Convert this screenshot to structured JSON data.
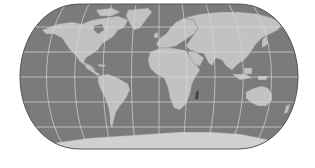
{
  "map": {
    "type": "world-map",
    "projection": "pseudo-cylindrical (Eckert IV-like)",
    "colors": {
      "background": "#ffffff",
      "ocean": "#7b7b7b",
      "land": "#c2c2c2",
      "land_dark": "#9a9a9a",
      "graticule": "#d8d8d8",
      "outline": "#4a4a4a",
      "ice": "#d0d0d0"
    },
    "graticule": {
      "latitude_step_deg": 30,
      "longitude_step_deg": 30
    },
    "regions": [
      "North America",
      "South America",
      "Greenland",
      "Europe",
      "Africa",
      "Asia",
      "Australia",
      "Antarctica",
      "Madagascar"
    ]
  }
}
